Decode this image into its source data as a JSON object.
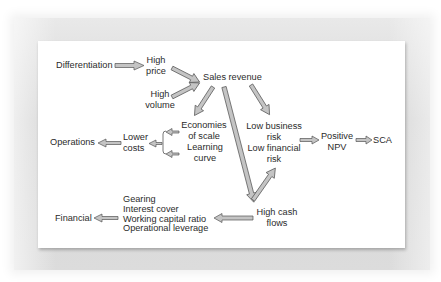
{
  "diagram": {
    "nodes": {
      "differentiation": "Differentiation",
      "high_price": [
        "High",
        "price"
      ],
      "high_volume": [
        "High",
        "volume"
      ],
      "sales_revenue": "Sales revenue",
      "economies_of_scale": [
        "Economies",
        "of scale"
      ],
      "learning_curve": [
        "Learning",
        "curve"
      ],
      "lower_costs": [
        "Lower",
        "costs"
      ],
      "operations": "Operations",
      "low_business_risk": [
        "Low business",
        "risk"
      ],
      "low_financial_risk": [
        "Low financial",
        "risk"
      ],
      "positive_npv": [
        "Positive",
        "NPV"
      ],
      "sca": "SCA",
      "high_cash_flows": [
        "High cash",
        "flows"
      ],
      "financial_measures": [
        "Gearing",
        "Interest cover",
        "Working capital ratio",
        "Operational leverage"
      ],
      "financial": "Financial"
    },
    "edges": [
      {
        "from": "Differentiation",
        "to": "High price"
      },
      {
        "from": "High price",
        "to": "Sales revenue"
      },
      {
        "from": "High volume",
        "to": "Sales revenue"
      },
      {
        "from": "Sales revenue",
        "to": "Economies of scale"
      },
      {
        "from": "Sales revenue",
        "to": "Low business risk"
      },
      {
        "from": "Sales revenue",
        "to": "High cash flows"
      },
      {
        "from": "Economies of scale",
        "to": "Lower costs"
      },
      {
        "from": "Learning curve",
        "to": "Lower costs"
      },
      {
        "from": "Lower costs",
        "to": "Operations"
      },
      {
        "from": "High cash flows",
        "to": "Low financial risk"
      },
      {
        "from": "Low business risk / Low financial risk",
        "to": "Positive NPV"
      },
      {
        "from": "Positive NPV",
        "to": "SCA"
      },
      {
        "from": "High cash flows",
        "to": "Gearing / Interest cover / Working capital ratio / Operational leverage"
      },
      {
        "from": "Gearing / Interest cover / Working capital ratio / Operational leverage",
        "to": "Financial"
      }
    ],
    "colors": {
      "arrow_fill": "#c4c4c4",
      "arrow_stroke": "#5a5a5a",
      "text": "#2b2b2b",
      "panel": "#ffffff",
      "frame": "#d8d8d8"
    }
  }
}
